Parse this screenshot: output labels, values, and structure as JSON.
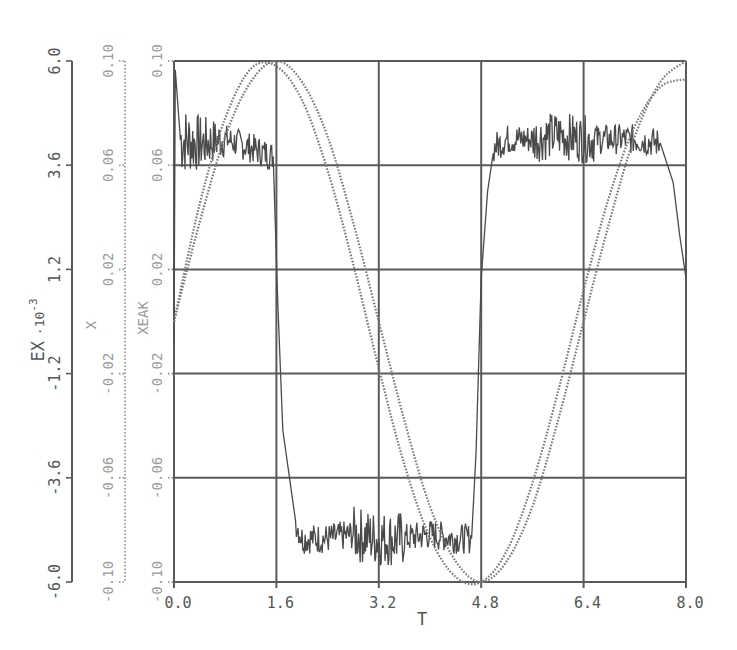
{
  "chart_data": {
    "type": "line",
    "title": "",
    "xlabel": "T",
    "x_ticks": [
      "0.0",
      "1.6",
      "3.2",
      "4.8",
      "6.4",
      "8.0"
    ],
    "xlim": [
      0.0,
      8.0
    ],
    "grid": true,
    "legend": null,
    "y_axes": [
      {
        "label": "EX",
        "label_suffix": "·10",
        "label_exponent": "-3",
        "ticks": [
          "-6.0",
          "-3.6",
          "-1.2",
          "1.2",
          "3.6",
          "6.0"
        ],
        "ylim": [
          -6.0,
          6.0
        ],
        "style": "solid"
      },
      {
        "label": "X",
        "ticks": [
          "-0.10",
          "-0.06",
          "-0.02",
          "0.02",
          "0.06",
          "0.10"
        ],
        "ylim": [
          -0.1,
          0.1
        ],
        "style": "dotted"
      },
      {
        "label": "XEAK",
        "ticks": [
          "-0.10",
          "-0.06",
          "-0.02",
          "0.02",
          "0.06",
          "0.10"
        ],
        "ylim": [
          -0.1,
          0.1
        ],
        "style": "dotted"
      }
    ],
    "series": [
      {
        "name": "EX",
        "axis": 0,
        "style": "solid noisy",
        "x": [
          0.0,
          0.02,
          0.1,
          0.4,
          0.8,
          1.2,
          1.55,
          1.62,
          1.7,
          1.9,
          2.0,
          2.4,
          2.8,
          3.2,
          3.6,
          4.0,
          4.4,
          4.65,
          4.72,
          4.8,
          4.9,
          5.0,
          5.2,
          5.6,
          6.0,
          6.4,
          6.8,
          7.2,
          7.6,
          7.8,
          7.9,
          8.0
        ],
        "y": [
          -0.5,
          5.8,
          4.2,
          4.1,
          4.2,
          4.0,
          3.8,
          0.5,
          -2.5,
          -4.6,
          -5.0,
          -5.0,
          -4.9,
          -5.0,
          -5.0,
          -4.9,
          -5.0,
          -5.0,
          -3.0,
          1.0,
          3.0,
          4.0,
          4.2,
          4.2,
          4.3,
          4.2,
          4.2,
          4.2,
          4.1,
          3.2,
          2.0,
          1.0
        ]
      },
      {
        "name": "X",
        "axis": 1,
        "style": "dotted",
        "x": [
          0.0,
          0.4,
          0.8,
          1.2,
          1.6,
          2.0,
          2.4,
          2.8,
          3.2,
          3.6,
          4.0,
          4.4,
          4.8,
          5.2,
          5.6,
          6.0,
          6.4,
          6.8,
          7.2,
          7.6,
          8.0
        ],
        "y": [
          0.0,
          0.038,
          0.071,
          0.092,
          0.1,
          0.092,
          0.071,
          0.038,
          0.0,
          -0.038,
          -0.071,
          -0.092,
          -0.1,
          -0.092,
          -0.071,
          -0.038,
          0.0,
          0.038,
          0.071,
          0.092,
          0.1
        ]
      },
      {
        "name": "XEAK",
        "axis": 2,
        "style": "dotted",
        "x": [
          0.0,
          0.4,
          0.8,
          1.2,
          1.6,
          2.0,
          2.4,
          2.8,
          3.2,
          3.6,
          4.0,
          4.4,
          4.8,
          5.2,
          5.6,
          6.0,
          6.4,
          6.8,
          7.2,
          7.6,
          8.0
        ],
        "y": [
          0.0,
          0.045,
          0.078,
          0.097,
          0.098,
          0.085,
          0.058,
          0.022,
          -0.018,
          -0.055,
          -0.083,
          -0.098,
          -0.1,
          -0.088,
          -0.062,
          -0.027,
          0.012,
          0.048,
          0.075,
          0.09,
          0.093
        ]
      }
    ]
  }
}
